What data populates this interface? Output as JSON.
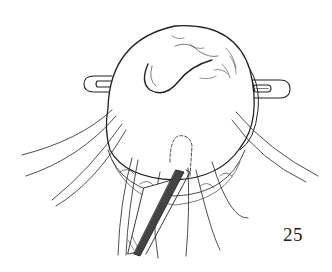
{
  "figure": {
    "number": "25",
    "colors": {
      "ink": "#222222",
      "background": "#ffffff"
    }
  }
}
